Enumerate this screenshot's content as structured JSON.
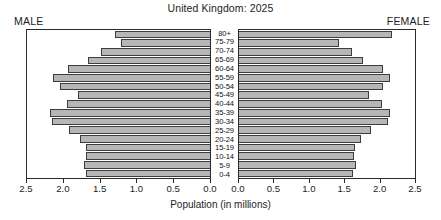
{
  "chart_data": {
    "type": "bar",
    "subtype": "population-pyramid",
    "title": "United Kingdom: 2025",
    "xlabel": "Population (in millions)",
    "ylabel": "",
    "grid": false,
    "legend_position": "none",
    "left_panel_label": "MALE",
    "right_panel_label": "FEMALE",
    "axis_direction_left": "reversed",
    "xlim": [
      0.0,
      2.5
    ],
    "xticks": [
      0.0,
      0.5,
      1.0,
      1.5,
      2.0,
      2.5
    ],
    "xtick_labels_left": [
      "2.5",
      "2.0",
      "1.5",
      "1.0",
      "0.5",
      "0.0"
    ],
    "xtick_labels_right": [
      "0.0",
      "0.5",
      "1.0",
      "1.5",
      "2.0",
      "2.5"
    ],
    "categories": [
      "80+",
      "75-79",
      "70-74",
      "65-69",
      "60-64",
      "55-59",
      "50-54",
      "45-49",
      "40-44",
      "35-39",
      "30-34",
      "25-29",
      "20-24",
      "15-19",
      "10-14",
      "5-9",
      "0-4"
    ],
    "series": [
      {
        "name": "MALE",
        "side": "left",
        "values": [
          1.3,
          1.22,
          1.49,
          1.67,
          1.94,
          2.14,
          2.05,
          1.81,
          1.96,
          2.19,
          2.16,
          1.92,
          1.77,
          1.69,
          1.69,
          1.72,
          1.7
        ]
      },
      {
        "name": "FEMALE",
        "side": "right",
        "values": [
          2.18,
          1.42,
          1.6,
          1.76,
          2.04,
          2.14,
          2.05,
          1.85,
          2.03,
          2.14,
          2.11,
          1.87,
          1.74,
          1.65,
          1.64,
          1.66,
          1.62
        ]
      }
    ],
    "colors": {
      "bar_fill": "#b6b6b6",
      "bar_stroke": "#3d3d3d",
      "axis": "#2b2b2b",
      "text": "#1d1d1d",
      "background": "#ffffff"
    }
  }
}
